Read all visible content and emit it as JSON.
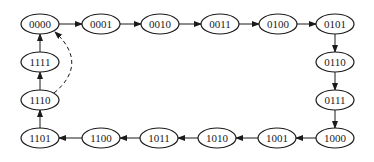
{
  "diagram": {
    "type": "state-transition",
    "colors": {
      "stroke": "#1a1a1a",
      "fill": "#ffffff",
      "background": "#ffffff"
    },
    "nodes": [
      {
        "id": "n0",
        "label": "0000",
        "x": 40,
        "y": 24
      },
      {
        "id": "n1",
        "label": "0001",
        "x": 101,
        "y": 24
      },
      {
        "id": "n2",
        "label": "0010",
        "x": 160,
        "y": 24
      },
      {
        "id": "n3",
        "label": "0011",
        "x": 220,
        "y": 24
      },
      {
        "id": "n4",
        "label": "0100",
        "x": 278,
        "y": 24
      },
      {
        "id": "n5",
        "label": "0101",
        "x": 335,
        "y": 24
      },
      {
        "id": "n6",
        "label": "0110",
        "x": 335,
        "y": 62
      },
      {
        "id": "n7",
        "label": "0111",
        "x": 335,
        "y": 100
      },
      {
        "id": "n8",
        "label": "1000",
        "x": 335,
        "y": 138
      },
      {
        "id": "n9",
        "label": "1001",
        "x": 277,
        "y": 138
      },
      {
        "id": "n10",
        "label": "1010",
        "x": 217,
        "y": 138
      },
      {
        "id": "n11",
        "label": "1011",
        "x": 159,
        "y": 138
      },
      {
        "id": "n12",
        "label": "1100",
        "x": 101,
        "y": 138
      },
      {
        "id": "n13",
        "label": "1101",
        "x": 40,
        "y": 138
      },
      {
        "id": "n14",
        "label": "1110",
        "x": 40,
        "y": 100
      },
      {
        "id": "n15",
        "label": "1111",
        "x": 40,
        "y": 62
      }
    ],
    "edges": [
      {
        "from": "n0",
        "to": "n1",
        "style": "solid"
      },
      {
        "from": "n1",
        "to": "n2",
        "style": "solid"
      },
      {
        "from": "n2",
        "to": "n3",
        "style": "solid"
      },
      {
        "from": "n3",
        "to": "n4",
        "style": "solid"
      },
      {
        "from": "n4",
        "to": "n5",
        "style": "solid"
      },
      {
        "from": "n5",
        "to": "n6",
        "style": "solid"
      },
      {
        "from": "n6",
        "to": "n7",
        "style": "solid"
      },
      {
        "from": "n7",
        "to": "n8",
        "style": "solid"
      },
      {
        "from": "n8",
        "to": "n9",
        "style": "solid"
      },
      {
        "from": "n9",
        "to": "n10",
        "style": "solid"
      },
      {
        "from": "n10",
        "to": "n11",
        "style": "solid"
      },
      {
        "from": "n11",
        "to": "n12",
        "style": "solid"
      },
      {
        "from": "n12",
        "to": "n13",
        "style": "solid"
      },
      {
        "from": "n13",
        "to": "n14",
        "style": "solid"
      },
      {
        "from": "n14",
        "to": "n15",
        "style": "solid"
      },
      {
        "from": "n15",
        "to": "n0",
        "style": "solid"
      },
      {
        "from": "n14",
        "to": "n0",
        "style": "dashed"
      }
    ],
    "node_rx": 19,
    "node_ry": 10
  }
}
